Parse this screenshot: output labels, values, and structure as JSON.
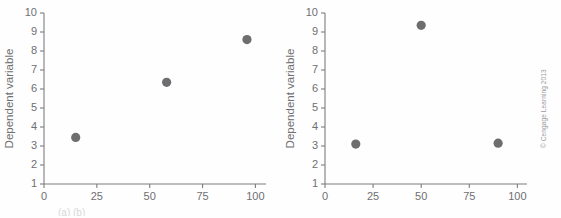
{
  "figure": {
    "background_color": "#fefefe",
    "axis_color": "#7d7d80",
    "marker_color": "#6e6e70",
    "text_color": "#6f6f72",
    "copyright": "© Cengage Learning 2013",
    "caption_fragment": "(a)        (b)"
  },
  "chart_data": [
    {
      "type": "scatter",
      "panel": "left",
      "title": "",
      "xlabel": "",
      "ylabel": "Dependent variable",
      "xlim": [
        0,
        105
      ],
      "ylim": [
        1,
        10
      ],
      "xticks": [
        0,
        25,
        50,
        75,
        100
      ],
      "xtick_labels": [
        "0",
        "25",
        "50",
        "75",
        "100"
      ],
      "yticks": [
        1,
        2,
        3,
        4,
        5,
        6,
        7,
        8,
        9,
        10
      ],
      "ytick_labels": [
        "1",
        "2",
        "3",
        "4",
        "5",
        "6",
        "7",
        "8",
        "9",
        "10"
      ],
      "grid": false,
      "legend": null,
      "points": [
        {
          "x": 15,
          "y": 3.45
        },
        {
          "x": 58,
          "y": 6.35
        },
        {
          "x": 96,
          "y": 8.6
        }
      ]
    },
    {
      "type": "scatter",
      "panel": "right",
      "title": "",
      "xlabel": "",
      "ylabel": "Dependent variable",
      "xlim": [
        0,
        105
      ],
      "ylim": [
        1,
        10
      ],
      "xticks": [
        0,
        25,
        50,
        75,
        100
      ],
      "xtick_labels": [
        "0",
        "25",
        "50",
        "75",
        "100"
      ],
      "yticks": [
        1,
        2,
        3,
        4,
        5,
        6,
        7,
        8,
        9,
        10
      ],
      "ytick_labels": [
        "1",
        "2",
        "3",
        "4",
        "5",
        "6",
        "7",
        "8",
        "9",
        "10"
      ],
      "grid": false,
      "legend": null,
      "points": [
        {
          "x": 16,
          "y": 3.1
        },
        {
          "x": 50,
          "y": 9.35
        },
        {
          "x": 90,
          "y": 3.15
        }
      ]
    }
  ]
}
